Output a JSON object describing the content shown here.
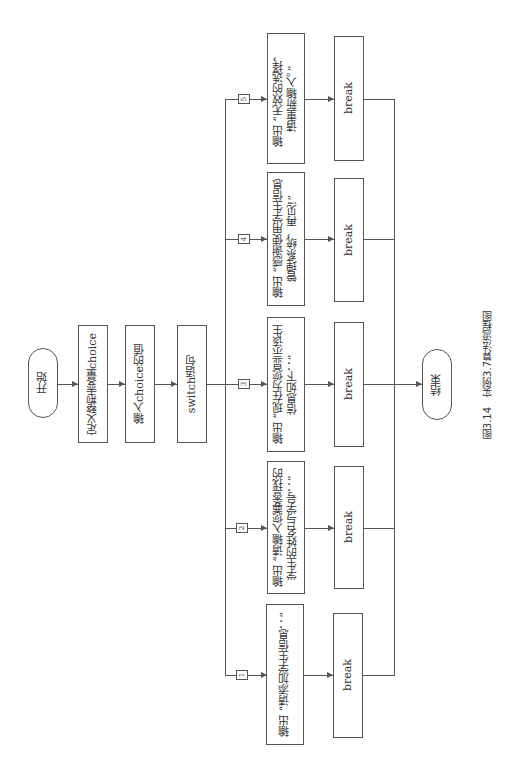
{
  "diagram": {
    "type": "flowchart",
    "orientation": "rotated-90-ccw",
    "start": "开始",
    "steps": [
      "定义整型变量choice",
      "输入choice的值",
      "switch语句"
    ],
    "cases": [
      {
        "label": "1",
        "action": "输出 “请添加学生信息：”",
        "break": "break"
      },
      {
        "label": "2",
        "action": "输出 “请输入您要查找的\n学生的姓名与学号：”",
        "break": "break"
      },
      {
        "label": "3",
        "action": "输出 “现在为您显示该生\n信息如下：”",
        "break": "break"
      },
      {
        "label": "4",
        "action": "输出 “感谢使用学生信息\n管理系统，再见!”",
        "break": "break"
      },
      {
        "label": "5",
        "action": "输出 “无效的选择，\n请重新输入。”",
        "break": "break"
      }
    ],
    "end": "结束",
    "caption": "图3.14　实例3.7算法流程图"
  }
}
